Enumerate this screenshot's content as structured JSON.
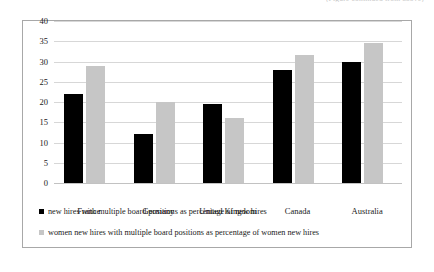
{
  "caption_fragment": "(Figure continued from above)",
  "chart_data": {
    "type": "bar",
    "title": "",
    "subtitle": "",
    "xlabel": "",
    "ylabel": "",
    "ylim": [
      0,
      40
    ],
    "yticks": [
      "0",
      "5",
      "10",
      "15",
      "20",
      "25",
      "30",
      "35",
      "40"
    ],
    "ytick_values": [
      0,
      5,
      10,
      15,
      20,
      25,
      30,
      35,
      40
    ],
    "grid": true,
    "legend_position": "bottom-left",
    "categories": [
      "France",
      "Germany",
      "United Kingdom",
      "Canada",
      "Australia"
    ],
    "series": [
      {
        "name": "new hires with multiple board positions as percentage of new hires",
        "color": "#000000",
        "values": [
          22,
          12,
          19.5,
          28,
          30
        ]
      },
      {
        "name": "women new hires with multiple board positions as percentage of women new hires",
        "color": "#c6c6c6",
        "values": [
          29,
          20,
          16,
          31.5,
          34.5
        ]
      }
    ]
  }
}
